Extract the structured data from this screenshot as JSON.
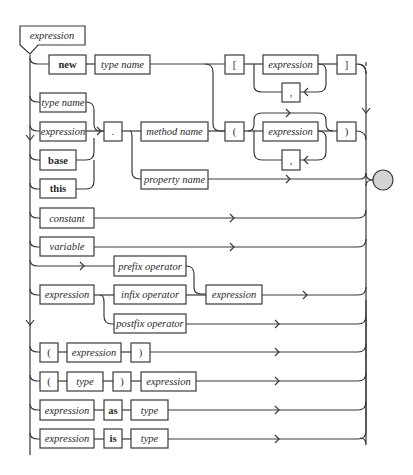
{
  "diagram": {
    "title": "expression",
    "rows": {
      "new_row": {
        "keyword": "new",
        "type_name": "type name"
      },
      "bracket_group": {
        "open": "[",
        "expression": "expression",
        "separator": ",",
        "close": "]"
      },
      "paren_group": {
        "open": "(",
        "expression": "expression",
        "separator": ",",
        "close": ")"
      },
      "receivers": {
        "type_name": "type name",
        "expression": "expression",
        "base": "base",
        "this": "this"
      },
      "member_access": {
        "dot": ".",
        "method_name": "method name",
        "property_name": "property name"
      },
      "constant": "constant",
      "variable": "variable",
      "operators": {
        "prefix": "prefix operator",
        "operand_left": "expression",
        "infix": "infix operator",
        "operand_right": "expression",
        "postfix": "postfix operator"
      },
      "parenthesized": {
        "open": "(",
        "expression": "expression",
        "close": ")"
      },
      "cast": {
        "open": "(",
        "type": "type",
        "close": ")",
        "expression": "expression"
      },
      "as_row": {
        "expression": "expression",
        "keyword": "as",
        "type": "type"
      },
      "is_row": {
        "expression": "expression",
        "keyword": "is",
        "type": "type"
      }
    },
    "colors": {
      "stroke": "#3a3a3a",
      "end_fill": "#d4d4d4",
      "background": "#ffffff"
    }
  }
}
